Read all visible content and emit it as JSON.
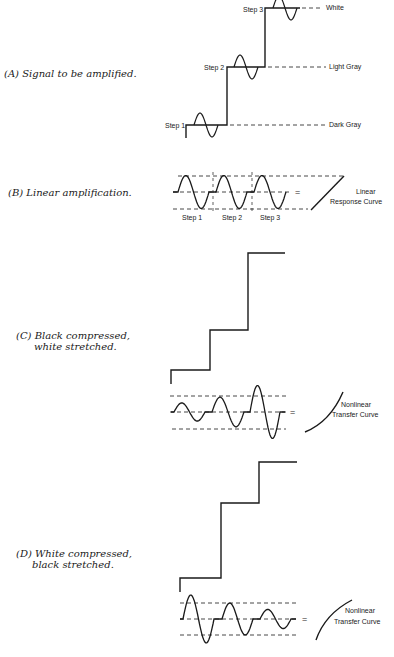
{
  "figure": {
    "panels": [
      {
        "id": "A",
        "caption_letter": "(A)",
        "caption_line1": "Signal to be amplified.",
        "caption_line2": "",
        "step_labels": [
          "Step 1",
          "Step 2",
          "Step 3"
        ],
        "level_labels": [
          "Dark Gray",
          "Light Gray",
          "White"
        ]
      },
      {
        "id": "B",
        "caption_letter": "(B)",
        "caption_line1": "Linear amplification.",
        "caption_line2": "",
        "step_labels": [
          "Step 1",
          "Step 2",
          "Step 3"
        ],
        "equals": "=",
        "curve_label_line1": "Linear",
        "curve_label_line2": "Response Curve"
      },
      {
        "id": "C",
        "caption_letter": "(C)",
        "caption_line1": "Black compressed,",
        "caption_line2": "white stretched.",
        "equals": "=",
        "curve_label_line1": "Nonlinear",
        "curve_label_line2": "Transfer Curve",
        "relative_amplitudes": [
          0.55,
          0.9,
          1.6
        ]
      },
      {
        "id": "D",
        "caption_letter": "(D)",
        "caption_line1": "White compressed,",
        "caption_line2": "black stretched.",
        "equals": "=",
        "curve_label_line1": "Nonlinear",
        "curve_label_line2": "Transfer Curve",
        "relative_amplitudes": [
          1.5,
          1.0,
          0.6
        ]
      }
    ],
    "bottom_caption": "Fig. Effects of amplifier nonlinearity on gray levels."
  }
}
